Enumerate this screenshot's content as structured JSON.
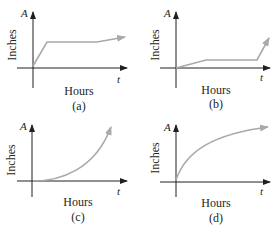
{
  "figure": {
    "panels": [
      {
        "id": "a",
        "caption": "(a)",
        "y_axis_var": "A",
        "y_axis_label": "Inches",
        "x_axis_var": "t",
        "x_axis_label": "Hours",
        "shape": "steep linear rise, then nearly flat with slight rise"
      },
      {
        "id": "b",
        "caption": "(b)",
        "y_axis_var": "A",
        "y_axis_label": "Inches",
        "x_axis_var": "t",
        "x_axis_label": "Hours",
        "shape": "gentle rise, flat plateau, then steep rise"
      },
      {
        "id": "c",
        "caption": "(c)",
        "y_axis_var": "A",
        "y_axis_label": "Inches",
        "x_axis_var": "t",
        "x_axis_label": "Hours",
        "shape": "concave up, increasing (exponential-like)"
      },
      {
        "id": "d",
        "caption": "(d)",
        "y_axis_var": "A",
        "y_axis_label": "Inches",
        "x_axis_var": "t",
        "x_axis_label": "Hours",
        "shape": "concave down, increasing (logarithmic-like)"
      }
    ],
    "colors": {
      "axis": "#231f20",
      "curve": "#a7a9ac",
      "text": "#231f20"
    }
  }
}
